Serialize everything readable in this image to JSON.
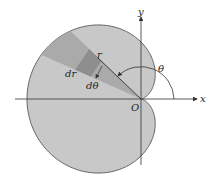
{
  "figure": {
    "labels": {
      "x_axis": "x",
      "y_axis": "y",
      "origin": "O",
      "angle": "θ",
      "radius": "r",
      "dr": "dr",
      "dtheta": "dθ"
    },
    "colors": {
      "fill": "#c8c8c8",
      "wedge": "#a9a9a9",
      "element": "#8f8f8f",
      "stroke": "#555555",
      "axis": "#333333"
    }
  }
}
